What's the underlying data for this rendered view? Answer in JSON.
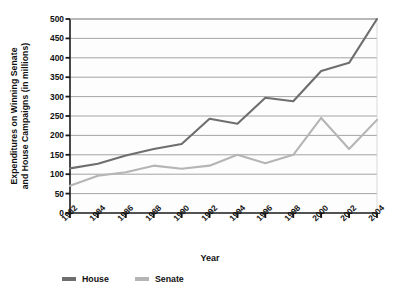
{
  "chart_data": {
    "type": "line",
    "title": "",
    "xlabel": "Year",
    "ylabel": "Expenditures on Winning Senate and House Campaigns (in millions)",
    "ylabel_line1": "Expenditures on Winning Senate",
    "ylabel_line2": "and House Campaigns (in millions)",
    "categories": [
      "1982",
      "1984",
      "1986",
      "1988",
      "1990",
      "1992",
      "1994",
      "1996",
      "1998",
      "2000",
      "2002",
      "2004"
    ],
    "x": [
      1982,
      1984,
      1986,
      1988,
      1990,
      1992,
      1994,
      1996,
      1998,
      2000,
      2002,
      2004
    ],
    "series": [
      {
        "name": "House",
        "color": "#6e6e6e",
        "values": [
          115,
          127,
          148,
          165,
          178,
          243,
          230,
          297,
          288,
          366,
          387,
          500
        ]
      },
      {
        "name": "Senate",
        "color": "#b5b5b5",
        "values": [
          70,
          96,
          105,
          122,
          114,
          122,
          150,
          128,
          150,
          245,
          165,
          240
        ]
      }
    ],
    "ylim": [
      0,
      500
    ],
    "yticks": [
      0,
      50,
      100,
      150,
      200,
      250,
      300,
      350,
      400,
      450,
      500
    ],
    "ytick_labels": [
      "0",
      "50",
      "100",
      "150",
      "200",
      "250",
      "300",
      "350",
      "400",
      "450",
      "500"
    ],
    "grid": true,
    "grid_axis": "y",
    "grid_color": "#9a9a9a",
    "legend_position": "bottom-left",
    "legend_entries": [
      "House",
      "Senate"
    ],
    "axis_color": "#1a1a1a",
    "background_color": "#ffffff"
  },
  "legend": {
    "items": [
      {
        "label": "House",
        "color": "#6e6e6e"
      },
      {
        "label": "Senate",
        "color": "#b5b5b5"
      }
    ]
  }
}
